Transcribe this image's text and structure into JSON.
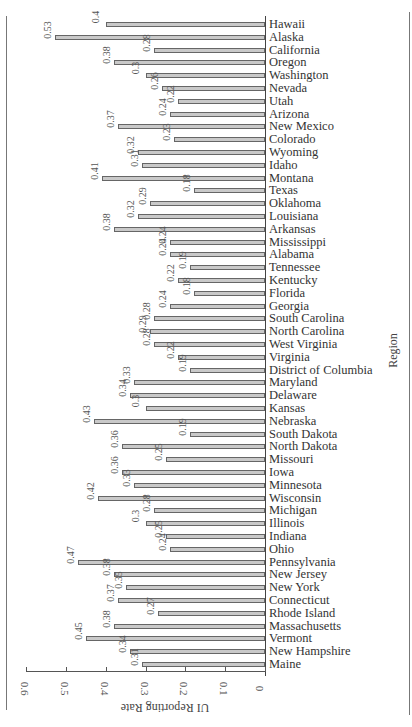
{
  "chart_data": {
    "type": "bar",
    "orientation": "horizontal",
    "title": "",
    "xlabel": "UI Reporting Rate",
    "ylabel": "Region",
    "xlim": [
      0,
      0.6
    ],
    "x_ticks": [
      "0.6",
      "0.5",
      "0.4",
      "0.3",
      "0.2",
      "0.1",
      "0"
    ],
    "grid": false,
    "legend": null,
    "categories": [
      "Hawaii",
      "Alaska",
      "California",
      "Oregon",
      "Washington",
      "Nevada",
      "Utah",
      "Arizona",
      "New Mexico",
      "Colorado",
      "Wyoming",
      "Idaho",
      "Montana",
      "Texas",
      "Oklahoma",
      "Louisiana",
      "Arkansas",
      "Mississippi",
      "Alabama",
      "Tennessee",
      "Kentucky",
      "Florida",
      "Georgia",
      "South Carolina",
      "North Carolina",
      "West Virginia",
      "Virginia",
      "District of Columbia",
      "Maryland",
      "Delaware",
      "Kansas",
      "Nebraska",
      "South Dakota",
      "North Dakota",
      "Missouri",
      "Iowa",
      "Minnesota",
      "Wisconsin",
      "Michigan",
      "Illinois",
      "Indiana",
      "Ohio",
      "Pennsylvania",
      "New Jersey",
      "New York",
      "Connecticut",
      "Rhode Island",
      "Massachusetts",
      "Vermont",
      "New Hampshire",
      "Maine"
    ],
    "values": [
      0.4,
      0.53,
      0.28,
      0.38,
      0.3,
      0.26,
      0.22,
      0.24,
      0.37,
      0.23,
      0.32,
      0.31,
      0.41,
      0.18,
      0.29,
      0.32,
      0.38,
      0.24,
      0.24,
      0.19,
      0.22,
      0.18,
      0.24,
      0.28,
      0.29,
      0.28,
      0.22,
      0.19,
      0.33,
      0.34,
      0.3,
      0.43,
      0.19,
      0.36,
      0.25,
      0.36,
      0.33,
      0.42,
      0.28,
      0.3,
      0.25,
      0.24,
      0.47,
      0.38,
      0.35,
      0.37,
      0.27,
      0.38,
      0.45,
      0.34,
      0.31
    ],
    "value_labels": [
      "0.4",
      "0.53",
      "0.28",
      "0.38",
      "0.3",
      "0.26",
      "0.22",
      "0.24",
      "0.37",
      "0.23",
      "0.32",
      "0.31",
      "0.41",
      "0.18",
      "0.29",
      "0.32",
      "0.38",
      "0.24",
      "0.24",
      "0.19",
      "0.22",
      "0.18",
      "0.24",
      "0.28",
      "0.29",
      "0.28",
      "0.22",
      "0.19",
      "0.33",
      "0.34",
      "0.3",
      "0.43",
      "0.19",
      "0.36",
      "0.25",
      "0.36",
      "0.33",
      "0.42",
      "0.28",
      "0.3",
      "0.25",
      "0.24",
      "0.47",
      "0.38",
      "0.35",
      "0.37",
      "0.27",
      "0.38",
      "0.45",
      "0.34",
      "0.31"
    ],
    "colors": {
      "bar_fill": "#c9c9c9",
      "bar_border": "#666666"
    }
  }
}
